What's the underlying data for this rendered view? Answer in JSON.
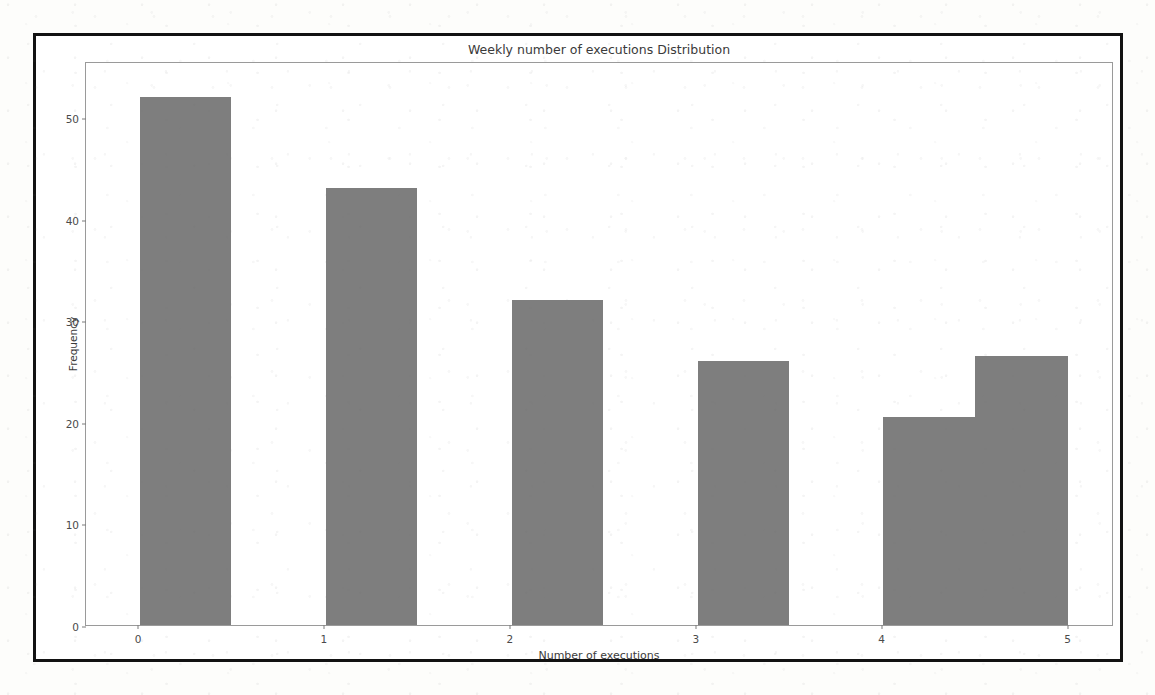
{
  "page": {
    "ghost_text": "",
    "background_color": "#fdfdfb",
    "frame_color": "#121212"
  },
  "chart_data": {
    "type": "bar",
    "title": "Weekly number of executions Distribution",
    "xlabel": "Number of executions",
    "ylabel": "Frequency",
    "bar_color": "#7e7e7e",
    "grid": false,
    "legend": null,
    "xlim": [
      -0.28,
      5.25
    ],
    "ylim": [
      0,
      55.5
    ],
    "xticks": [
      0,
      1,
      2,
      3,
      4,
      5
    ],
    "xtick_labels": [
      "0",
      "1",
      "2",
      "3",
      "4",
      "5"
    ],
    "yticks": [
      0,
      10,
      20,
      30,
      40,
      50
    ],
    "ytick_labels": [
      "0",
      "10",
      "20",
      "30",
      "40",
      "50"
    ],
    "categories": [
      "0",
      "1",
      "2",
      "3",
      "4",
      "5"
    ],
    "values": [
      52,
      43,
      32,
      26,
      20.5,
      26.5
    ],
    "bins": [
      {
        "label": "0",
        "x_start": 0.01,
        "x_end": 0.5,
        "value": 52
      },
      {
        "label": "1",
        "x_start": 1.01,
        "x_end": 1.5,
        "value": 43
      },
      {
        "label": "2",
        "x_start": 2.01,
        "x_end": 2.5,
        "value": 32
      },
      {
        "label": "3",
        "x_start": 3.01,
        "x_end": 3.5,
        "value": 26
      },
      {
        "label": "4",
        "x_start": 4.01,
        "x_end": 4.5,
        "value": 20.5
      },
      {
        "label": "4.5",
        "x_start": 4.5,
        "x_end": 5.0,
        "value": 26.5
      }
    ]
  }
}
